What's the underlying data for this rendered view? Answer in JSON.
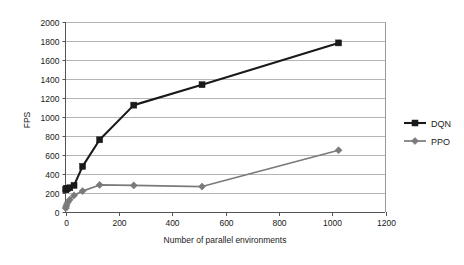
{
  "chart_data": {
    "type": "line",
    "title": "",
    "xlabel": "Number of parallel environments",
    "ylabel": "FPS",
    "xlim": [
      0,
      1200
    ],
    "ylim": [
      0,
      2000
    ],
    "xticks": [
      0,
      200,
      400,
      600,
      800,
      1000,
      1200
    ],
    "yticks": [
      0,
      200,
      400,
      600,
      800,
      1000,
      1200,
      1400,
      1600,
      1800,
      2000
    ],
    "grid": "horizontal",
    "legend_position": "right",
    "series": [
      {
        "name": "DQN",
        "color": "#1a1a1a",
        "marker": "square",
        "x": [
          1,
          2,
          4,
          8,
          16,
          32,
          64,
          128,
          256,
          512,
          1024
        ],
        "y": [
          235,
          240,
          245,
          250,
          255,
          280,
          480,
          760,
          1125,
          1340,
          1780
        ]
      },
      {
        "name": "PPO",
        "color": "#7a7a7a",
        "marker": "diamond",
        "x": [
          1,
          2,
          4,
          8,
          16,
          32,
          64,
          128,
          256,
          512,
          1024
        ],
        "y": [
          40,
          55,
          75,
          100,
          130,
          175,
          220,
          285,
          280,
          268,
          650
        ]
      }
    ]
  },
  "axes": {
    "y_label": "FPS",
    "x_label": "Number of parallel environments",
    "y_tick_labels": [
      "2000",
      "1800",
      "1600",
      "1400",
      "1200",
      "1000",
      "800",
      "600",
      "400",
      "200",
      "0"
    ],
    "x_tick_labels": [
      "0",
      "200",
      "400",
      "600",
      "800",
      "1000",
      "1200"
    ]
  },
  "legend": {
    "entries": [
      {
        "label": "DQN",
        "color": "#1a1a1a",
        "marker": "square-marker"
      },
      {
        "label": "PPO",
        "color": "#7a7a7a",
        "marker": "diamond-marker"
      }
    ]
  },
  "colors": {
    "dqn": "#1a1a1a",
    "ppo": "#7a7a7a",
    "grid": "#b5b5b5",
    "axis": "#555555",
    "background": "#ffffff"
  }
}
